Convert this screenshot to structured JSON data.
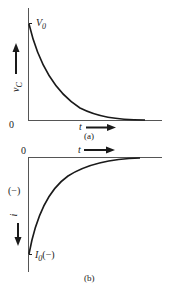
{
  "panels": [
    {
      "id": "a",
      "caption": "(a)",
      "y_label": "v",
      "y_label_sub": "C",
      "x_label": "t",
      "origin_label": "0",
      "start_label": "V",
      "start_label_sub": "0",
      "curve": "exponential decay from V0 toward 0"
    },
    {
      "id": "b",
      "caption": "(b)",
      "y_label": "i",
      "x_label": "t",
      "origin_label": "0",
      "sign_label": "(−)",
      "start_label": "I",
      "start_label_sub": "0",
      "start_label_suffix": "(−)",
      "curve": "exponential rise from I0(−) toward 0"
    }
  ],
  "colors": {
    "ink": "#1a1a1a",
    "axis": "#555555",
    "background": "#ffffff"
  }
}
